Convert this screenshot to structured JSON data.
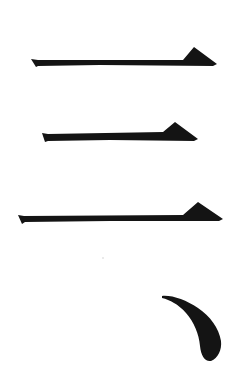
{
  "image": {
    "description": "Calligraphy brush strokes: three horizontal strokes (heng) with triangular end-pressure, followed by a dot stroke (dian)",
    "background_color": "#ffffff",
    "ink_color": "#141414",
    "width": 234,
    "height": 368
  },
  "strokes": [
    {
      "type": "horizontal",
      "name": "heng-1",
      "points": "31,59 38,60 183,60 194,47 217,64 213,66 100,65 38,66 36,67"
    },
    {
      "type": "horizontal",
      "name": "heng-2",
      "points": "42,133 48,134 163,132 175,122 198,139 194,141 110,140 48,141 45,142"
    },
    {
      "type": "horizontal",
      "name": "heng-3",
      "points": "18,215 24,216 183,215 198,202 223,219 219,221 110,221 25,222 22,224"
    },
    {
      "type": "dot",
      "name": "dian",
      "path": "M162,296 C172,295 186,300 198,308 C210,316 219,328 221,341 C222,350 218,358 211,361 C205,362 201,356 200,346 C199,334 194,322 186,313 C178,304 170,300 162,298 Z"
    }
  ],
  "speck": {
    "x": 103,
    "y": 258,
    "r": 0.8,
    "color": "#cfcfcf"
  }
}
